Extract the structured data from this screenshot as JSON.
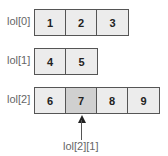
{
  "rows": [
    {
      "label": "lol[0]",
      "values": [
        "1",
        "2",
        "3"
      ]
    },
    {
      "label": "lol[1]",
      "values": [
        "4",
        "5"
      ]
    },
    {
      "label": "lol[2]",
      "values": [
        "6",
        "7",
        "8",
        "9"
      ]
    }
  ],
  "highlight": {
    "row": 2,
    "col": 1
  },
  "pointer": {
    "label": "lol[2][1]"
  },
  "colors": {
    "cell": "#ececec",
    "highlight": "#d0d0d0",
    "border": "#555555"
  }
}
